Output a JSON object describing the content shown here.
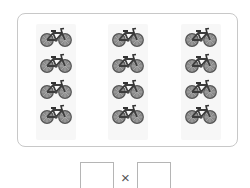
{
  "illustration": {
    "object": "bicycle",
    "groups": 3,
    "per_group": 4,
    "icon": "bicycle-icon",
    "color": "#6e6e6e"
  },
  "answer": {
    "left_box_value": "",
    "operator": "×",
    "right_box_value": ""
  }
}
